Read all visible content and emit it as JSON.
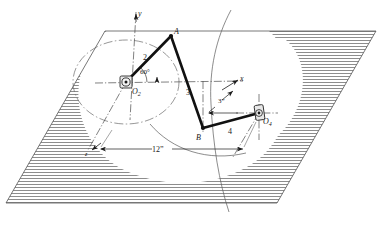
{
  "figure": {
    "type": "engineering-mechanism-diagram",
    "background_color": "#ffffff",
    "line_color": "#1a1a1a",
    "thin_line_color": "#4a4a4a",
    "hatch_color": "#707070"
  },
  "axes": {
    "y_label": "y",
    "x_label": "x",
    "z_label": "z",
    "origin_label": "O2"
  },
  "joints": [
    {
      "name": "O2",
      "label": "O",
      "subscript": "2",
      "kind": "bearing",
      "x": 126,
      "y": 82
    },
    {
      "name": "A",
      "label": "A",
      "subscript": "",
      "kind": "ball",
      "x": 171,
      "y": 36
    },
    {
      "name": "B",
      "label": "B",
      "subscript": "",
      "kind": "ball",
      "x": 203,
      "y": 128
    },
    {
      "name": "O4",
      "label": "O",
      "subscript": "4",
      "kind": "bearing",
      "x": 259,
      "y": 113
    }
  ],
  "links": [
    {
      "name": "link-2",
      "label": "2",
      "from": "O2",
      "to": "A",
      "label_x": 146,
      "label_y": 57
    },
    {
      "name": "link-3",
      "label": "3",
      "from": "A",
      "to": "B",
      "label_x": 189,
      "label_y": 92
    },
    {
      "name": "link-4",
      "label": "4",
      "from": "B",
      "to": "O4",
      "label_x": 230,
      "label_y": 131
    }
  ],
  "annotations": {
    "crank_angle": "60°",
    "crank_angle_x": 147,
    "crank_angle_y": 74,
    "offset_dim": "3”",
    "offset_dim_x": 222,
    "offset_dim_y": 102,
    "span_dim": "12”",
    "span_dim_x": 158,
    "span_dim_y": 148
  },
  "geometry": {
    "plane_corners": [
      {
        "x": 105,
        "y": 31
      },
      {
        "x": 376,
        "y": 31
      },
      {
        "x": 277,
        "y": 203
      },
      {
        "x": 6,
        "y": 203
      }
    ],
    "crank_circle": {
      "cx": 126,
      "cy": 82,
      "rx": 53,
      "ry": 42
    },
    "coupler_arc_top": {
      "d": "M 231,10 C 216,38 209,70 211,104"
    },
    "coupler_arc_bottom": {
      "d": "M 211,104 C 213,145 219,182 229,212"
    },
    "secondary_arc": {
      "d": "M 150,122 C 170,150 205,162 245,155"
    }
  }
}
